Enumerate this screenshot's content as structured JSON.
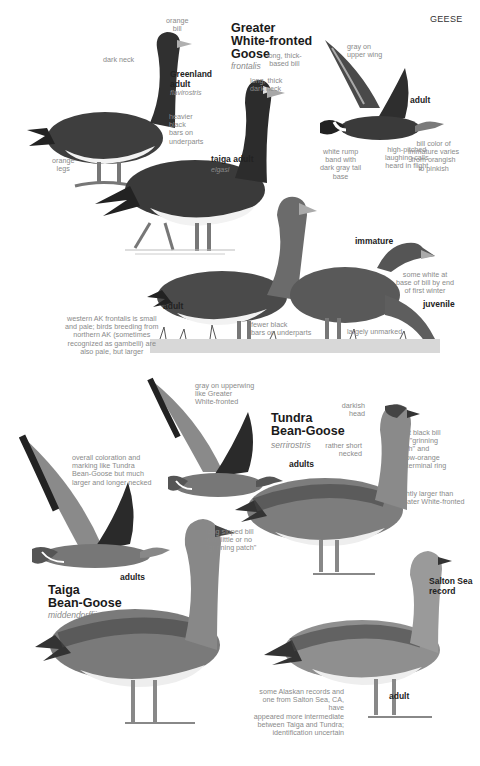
{
  "header": {
    "section": "GEESE"
  },
  "species": [
    {
      "id": "greater-white-fronted-goose",
      "name": "Greater\nWhite-fronted\nGoose",
      "subspecies": "frontalis",
      "figures": [
        {
          "age": "Greenland\nadult",
          "subspecies": "flavirostris",
          "notes": [
            "orange\nbill",
            "dark neck",
            "heavier\nblack\nbars on\nunderparts",
            "orange\nlegs"
          ]
        },
        {
          "age": "taiga adult",
          "subspecies": "elgasi",
          "notes": [
            "long, thick-\nbased bill",
            "long, thick\ndark neck"
          ]
        },
        {
          "age": "adult",
          "pose": "flight",
          "notes": [
            "gray on\nupper wing",
            "white rump\nband with\ndark gray tail\nbase",
            "high-pitched\nlaughing calls\nheard in flight"
          ]
        },
        {
          "age": "immature",
          "notes": [
            "bill color of\nimmature varies\nfrom orangish\nto pinkish",
            "some white at\nbase of bill by end\nof first winter"
          ]
        },
        {
          "age": "adult",
          "notes": [
            "western AK frontalis is small\nand pale; birds breeding from\nnorthern AK (sometimes\nrecognized as gambelli) are\nalso pale, but larger",
            "fewer black\nbars on underparts"
          ]
        },
        {
          "age": "juvenile",
          "notes": [
            "largely unmarked"
          ]
        }
      ]
    },
    {
      "id": "tundra-bean-goose",
      "name": "Tundra\nBean-Goose",
      "subspecies": "serrirostris",
      "figures": [
        {
          "age": "adults",
          "pose": "flight",
          "notes": [
            "gray on upperwing\nlike Greater\nWhite-fronted"
          ]
        },
        {
          "age": "adult",
          "pose": "standing",
          "notes": [
            "darkish\nhead",
            "rather short\nnecked",
            "short black bill\nwith \"grinning\npatch\" and\nyellow-orange\nsubterminal ring",
            "slightly larger than\nGreater White-fronted"
          ]
        },
        {
          "age": "Salton Sea\nrecord",
          "sub_age": "adult",
          "notes": [
            "some Alaskan records and\none from Salton Sea, CA, have\nappeared more intermediate\nbetween Taiga and Tundra;\nidentification uncertain"
          ]
        }
      ]
    },
    {
      "id": "taiga-bean-goose",
      "name": "Taiga\nBean-Goose",
      "subspecies": "middendorffii",
      "figures": [
        {
          "age": "adults",
          "pose": "flight",
          "notes": [
            "overall coloration and\nmarking like Tundra\nBean-Goose but much\nlarger and longer necked"
          ]
        },
        {
          "age": "adult",
          "pose": "standing",
          "notes": [
            "long sloped bill\nwith little or no\n\"grinning patch\""
          ]
        }
      ]
    }
  ],
  "colors": {
    "text_label": "#8a8a8a",
    "text_title": "#1a1a1a",
    "bird_dark": "#3a3a3a",
    "bird_mid": "#7a7a7a",
    "bird_light": "#c8c8c8",
    "belly": "#f2f2f2"
  }
}
